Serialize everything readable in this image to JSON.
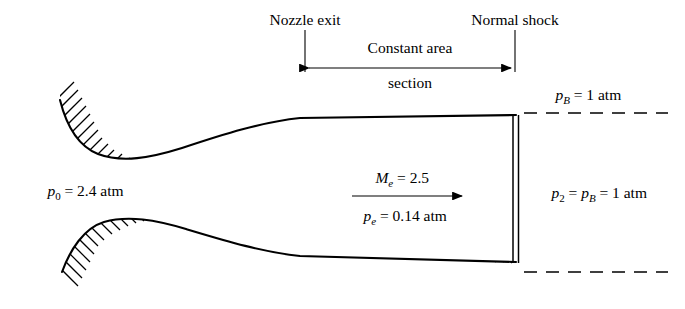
{
  "figure": {
    "background": "#ffffff",
    "ink": "#000000"
  },
  "labels": {
    "nozzle_exit": "Nozzle exit",
    "normal_shock": "Normal shock",
    "constant_area_line1": "Constant area",
    "constant_area_line2": "section",
    "p0_symbol": "p",
    "p0_sub": "0",
    "p0_value": " = 2.4 atm",
    "mach_symbol": "M",
    "mach_sub": "e",
    "mach_value": " = 2.5",
    "pe_symbol": "p",
    "pe_sub": "e",
    "pe_value": " = 0.14 atm",
    "pB_symbol": "p",
    "pB_sub": "B",
    "pB_value": " = 1 atm",
    "p2_symbol": "p",
    "p2_sub": "2",
    "p2_eq": " = ",
    "p2_symbol2": "p",
    "p2_sub2": "B",
    "p2_value": " = 1 atm"
  },
  "quantities": {
    "stagnation_pressure_atm": 2.4,
    "exit_mach_number": 2.5,
    "exit_pressure_atm": 0.14,
    "back_pressure_atm": 1,
    "post_shock_pressure_atm": 1
  },
  "geometry": {
    "upper_wall_path": "M 60,100 C 66,124 78,146 98,154 C 122,163 150,158 182,148 C 224,134 262,122 300,118 L 516,115",
    "lower_wall_path": "M 62,272 C 70,250 84,228 104,222 C 128,215 156,220 186,229 C 226,241 262,252 300,256 L 516,262",
    "shock_x_left": 513,
    "shock_x_right": 518,
    "shock_top_y": 115,
    "shock_bottom_y": 263,
    "dim_left_x": 305,
    "dim_right_x": 515,
    "dim_arrow_y": 68,
    "dashed_upper_y": 113,
    "dashed_lower_y": 272,
    "dashed_x_start": 524,
    "dashed_x_end": 668
  }
}
